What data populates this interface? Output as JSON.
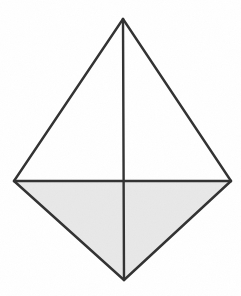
{
  "figure": {
    "canvas": {
      "width": 241,
      "height": 296,
      "background": "#ffffff"
    },
    "style": {
      "stroke_color": "#333333",
      "stroke_width": 2.4,
      "shaded_fill": "#e8e8e8",
      "unshaded_fill": "#ffffff"
    },
    "vertices": {
      "top": {
        "label": "apex",
        "x": 123,
        "y": 19
      },
      "left": {
        "label": "left vertex",
        "x": 14,
        "y": 181
      },
      "right": {
        "label": "right vertex",
        "x": 231,
        "y": 181
      },
      "bottom": {
        "label": "bottom vertex",
        "x": 124,
        "y": 280
      }
    },
    "regions": [
      {
        "name": "upper-left-triangle",
        "points": "123,19 14,181 123,181",
        "fill": "#ffffff",
        "shaded": false
      },
      {
        "name": "upper-right-triangle",
        "points": "123,19 231,181 123,181",
        "fill": "#ffffff",
        "shaded": false
      },
      {
        "name": "lower-left-triangle",
        "points": "14,181 124,280 123,181",
        "fill": "#e8e8e8",
        "shaded": true
      },
      {
        "name": "lower-right-triangle",
        "points": "231,181 124,280 123,181",
        "fill": "#e8e8e8",
        "shaded": true
      }
    ],
    "edges": [
      {
        "name": "upper-left-edge",
        "x1": 123,
        "y1": 19,
        "x2": 14,
        "y2": 181
      },
      {
        "name": "upper-right-edge",
        "x1": 123,
        "y1": 19,
        "x2": 231,
        "y2": 181
      },
      {
        "name": "lower-left-edge",
        "x1": 14,
        "y1": 181,
        "x2": 124,
        "y2": 280
      },
      {
        "name": "lower-right-edge",
        "x1": 231,
        "y1": 181,
        "x2": 124,
        "y2": 280
      }
    ],
    "diagonals": [
      {
        "name": "horizontal-diagonal",
        "x1": 14,
        "y1": 181,
        "x2": 231,
        "y2": 181
      },
      {
        "name": "vertical-diagonal",
        "x1": 123,
        "y1": 19,
        "x2": 124,
        "y2": 280
      }
    ]
  }
}
